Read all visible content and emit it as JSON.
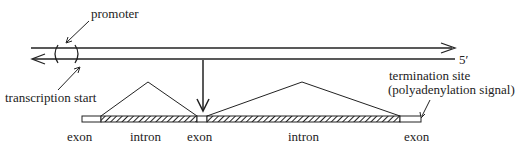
{
  "diagram": {
    "type": "gene-structure",
    "labels": {
      "promoter": "promoter",
      "transcription_start": "transcription start",
      "five_prime": "5′",
      "termination_line1": "termination site",
      "termination_line2": "(polyadenylation signal)"
    },
    "segments": [
      {
        "kind": "exon",
        "label": "exon"
      },
      {
        "kind": "intron",
        "label": "intron"
      },
      {
        "kind": "exon",
        "label": "exon"
      },
      {
        "kind": "intron",
        "label": "intron"
      },
      {
        "kind": "exon",
        "label": "exon"
      }
    ],
    "colors": {
      "stroke": "#222222",
      "background": "#ffffff"
    }
  }
}
